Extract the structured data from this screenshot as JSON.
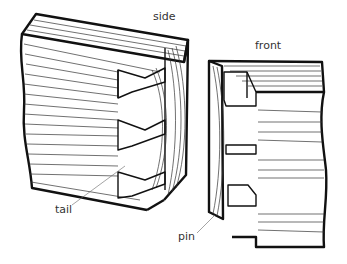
{
  "diagram": {
    "labels": {
      "side": "side",
      "front": "front",
      "tail": "tail",
      "pin": "pin"
    }
  }
}
